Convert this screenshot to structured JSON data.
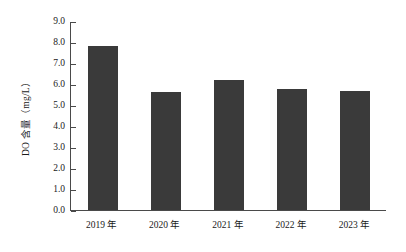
{
  "chart_data": {
    "type": "bar",
    "title": "",
    "subtitle": "",
    "xlabel": "",
    "ylabel": "DO 含量（mg/L）",
    "categories": [
      "2019 年",
      "2020 年",
      "2021 年",
      "2022 年",
      "2023 年"
    ],
    "values": [
      7.8,
      5.6,
      6.2,
      5.75,
      5.65
    ],
    "series": [
      {
        "name": "DO 含量",
        "values": [
          7.8,
          5.6,
          6.2,
          5.75,
          5.65
        ]
      }
    ],
    "ylim": [
      0.0,
      9.0
    ],
    "ytick_step": 1.0,
    "ytick_labels": [
      "0.0",
      "1.0",
      "2.0",
      "3.0",
      "4.0",
      "5.0",
      "6.0",
      "7.0",
      "8.0",
      "9.0"
    ],
    "grid": false,
    "legend": false,
    "legend_position": "none",
    "bar_color": "#3a3a3a",
    "axis_color": "#4a4a4a",
    "background_color": "#ffffff"
  }
}
